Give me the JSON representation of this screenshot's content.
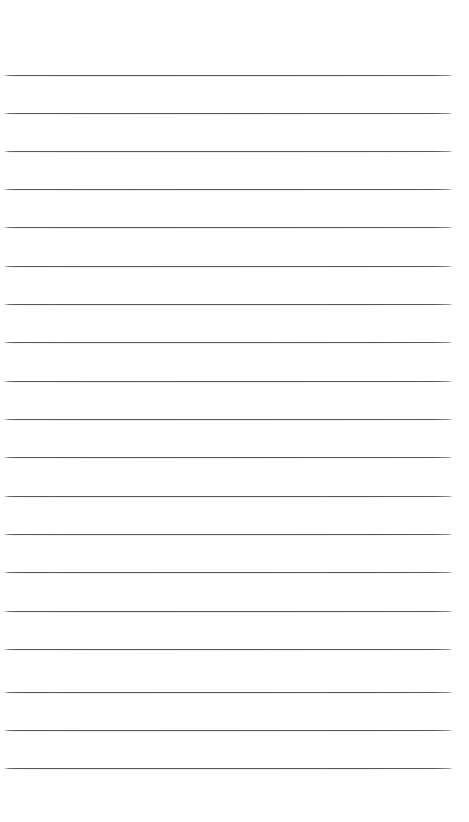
{
  "page": {
    "kind": "lined-paper-sheet",
    "width": 469,
    "height": 822,
    "background_color": "#ffffff",
    "content_text": ""
  },
  "rules": {
    "count": 19,
    "color": "#3c3c3c",
    "thickness_px": 1,
    "spacing_px": 38.5,
    "left_x": 3,
    "right_x": 453,
    "first_y": 75,
    "last_y": 768,
    "top_margin_px": 75,
    "bottom_margin_px": 54,
    "lines": [
      {
        "index": 1,
        "y": 75,
        "text": ""
      },
      {
        "index": 2,
        "y": 113,
        "text": ""
      },
      {
        "index": 3,
        "y": 151,
        "text": ""
      },
      {
        "index": 4,
        "y": 189,
        "text": ""
      },
      {
        "index": 5,
        "y": 227,
        "text": ""
      },
      {
        "index": 6,
        "y": 266,
        "text": ""
      },
      {
        "index": 7,
        "y": 304,
        "text": ""
      },
      {
        "index": 8,
        "y": 342,
        "text": ""
      },
      {
        "index": 9,
        "y": 381,
        "text": ""
      },
      {
        "index": 10,
        "y": 419,
        "text": ""
      },
      {
        "index": 11,
        "y": 457,
        "text": ""
      },
      {
        "index": 12,
        "y": 496,
        "text": ""
      },
      {
        "index": 13,
        "y": 534,
        "text": ""
      },
      {
        "index": 14,
        "y": 572,
        "text": ""
      },
      {
        "index": 15,
        "y": 611,
        "text": ""
      },
      {
        "index": 16,
        "y": 649,
        "text": ""
      },
      {
        "index": 17,
        "y": 692,
        "text": ""
      },
      {
        "index": 18,
        "y": 730,
        "text": ""
      },
      {
        "index": 19,
        "y": 768,
        "text": ""
      }
    ]
  }
}
